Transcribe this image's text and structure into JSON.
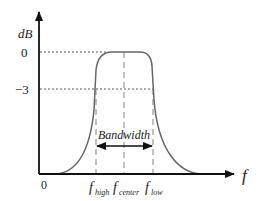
{
  "diagram": {
    "y_axis_label": "dB",
    "x_axis_label": "f",
    "origin_label": "0",
    "y_ticks": [
      {
        "label": "0",
        "value_db": 0
      },
      {
        "label": "−3",
        "value_db": -3
      }
    ],
    "x_markers": [
      {
        "base": "f",
        "sub": "high"
      },
      {
        "base": "f",
        "sub": "center"
      },
      {
        "base": "f",
        "sub": "low"
      }
    ],
    "bandwidth_label": "Bandwidth",
    "colors": {
      "axis": "#111111",
      "curve": "#666666",
      "guide": "#555555",
      "dashed": "#999999"
    }
  }
}
